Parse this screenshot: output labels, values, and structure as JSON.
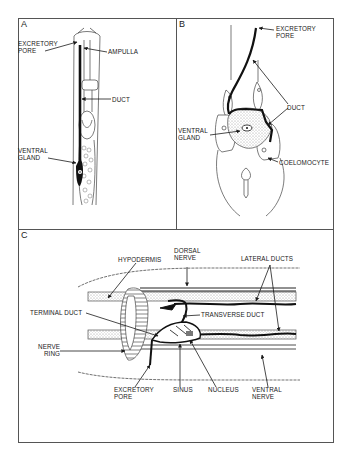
{
  "figure": {
    "panels": [
      {
        "id": "A",
        "letter": "A",
        "labels": {
          "excretory_pore": "EXCRETORY\nPORE",
          "ampulla": "AMPULLA",
          "duct": "DUCT",
          "ventral_gland": "VENTRAL\nGLAND"
        }
      },
      {
        "id": "B",
        "letter": "B",
        "labels": {
          "excretory_pore": "EXCRETORY\nPORE",
          "duct": "DUCT",
          "ventral_gland": "VENTRAL\nGLAND",
          "coelomocyte": "COELOMOCYTE"
        }
      },
      {
        "id": "C",
        "letter": "C",
        "labels": {
          "hypodermis": "HYPODERMIS",
          "dorsal_nerve": "DORSAL\nNERVE",
          "lateral_ducts": "LATERAL DUCTS",
          "terminal_duct": "TERMINAL DUCT",
          "transverse_duct": "TRANSVERSE DUCT",
          "nerve_ring": "NERVE\nRING",
          "excretory_pore": "EXCRETORY\nPORE",
          "sinus": "SINUS",
          "nucleus": "NUCLEUS",
          "ventral_nerve": "VENTRAL\nNERVE"
        }
      }
    ],
    "colors": {
      "ink": "#1a1a1a",
      "border": "#555555",
      "stipple": "#c8c8c8",
      "background": "#ffffff"
    }
  }
}
